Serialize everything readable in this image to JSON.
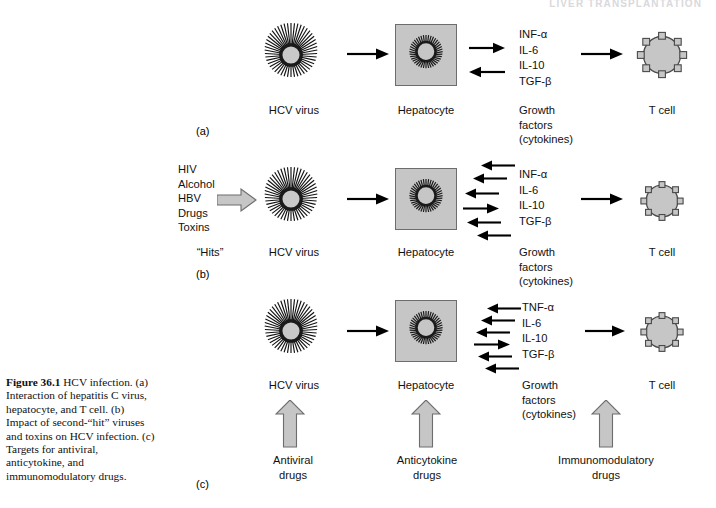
{
  "running_head": "LIVER TRANSPLANTATION",
  "caption": {
    "figure_number": "Figure 36.1",
    "text": "  HCV infection. (a) Interaction of hepatitis C virus, hepatocyte, and T cell. (b) Impact of second-“hit” viruses and toxins on HCV infection. (c) Targets for antiviral, anticytokine, and immunomodulatory drugs."
  },
  "colors": {
    "cell_fill": "#c6c6c6",
    "cell_stroke": "#6d6d6d",
    "arrow_black": "#000000",
    "block_arrow_fill": "#c6c6c6",
    "block_arrow_stroke": "#6d6d6d",
    "running_head": "#d9d9dd"
  },
  "panels": [
    {
      "id": "a",
      "letter": "(a)",
      "nodes": [
        {
          "name": "virus",
          "label": "HCV virus"
        },
        {
          "name": "hepatocyte",
          "label": "Hepatocyte"
        },
        {
          "name": "cytokines",
          "label": "Growth\nfactors\n(cytokines)"
        },
        {
          "name": "tcell",
          "label": "T cell"
        }
      ],
      "cytokines": [
        "INF-α",
        "IL-6",
        "IL-10",
        "TGF-β"
      ],
      "flow_arrows": [
        {
          "from": "virus",
          "to": "hepatocyte",
          "dir": "right"
        },
        {
          "from": "cytokines",
          "to": "tcell",
          "dir": "right"
        }
      ],
      "exchange_arrows": [
        "right",
        "left"
      ],
      "hits": null,
      "drugs": []
    },
    {
      "id": "b",
      "letter": "(b)",
      "nodes": [
        {
          "name": "hits",
          "label": "“Hits”"
        },
        {
          "name": "virus",
          "label": "HCV virus"
        },
        {
          "name": "hepatocyte",
          "label": "Hepatocyte"
        },
        {
          "name": "cytokines",
          "label": "Growth\nfactors\n(cytokines)"
        },
        {
          "name": "tcell",
          "label": "T cell"
        }
      ],
      "cytokines": [
        "INF-α",
        "IL-6",
        "IL-10",
        "TGF-β"
      ],
      "hits": [
        "HIV",
        "Alcohol",
        "HBV",
        "Drugs",
        "Toxins"
      ],
      "flow_arrows": [
        {
          "from": "virus",
          "to": "hepatocyte",
          "dir": "right"
        },
        {
          "from": "cytokines",
          "to": "tcell",
          "dir": "right"
        }
      ],
      "exchange_arrows": [
        "left",
        "left",
        "left",
        "right",
        "left",
        "left"
      ],
      "drugs": []
    },
    {
      "id": "c",
      "letter": "(c)",
      "nodes": [
        {
          "name": "virus",
          "label": "HCV virus"
        },
        {
          "name": "hepatocyte",
          "label": "Hepatocyte"
        },
        {
          "name": "cytokines",
          "label": "Growth\nfactors\n(cytokines)"
        },
        {
          "name": "tcell",
          "label": "T cell"
        }
      ],
      "cytokines": [
        "TNF-α",
        "IL-6",
        "IL-10",
        "TGF-β"
      ],
      "flow_arrows": [
        {
          "from": "virus",
          "to": "hepatocyte",
          "dir": "right"
        },
        {
          "from": "cytokines",
          "to": "tcell",
          "dir": "right"
        }
      ],
      "exchange_arrows": [
        "left",
        "left",
        "left",
        "right",
        "left",
        "left"
      ],
      "hits": null,
      "drugs": [
        {
          "target": "virus",
          "label": "Antiviral\ndrugs"
        },
        {
          "target": "hepatocyte",
          "label": "Anticytokine\ndrugs"
        },
        {
          "target": "cytokines",
          "label": "Immunomodulatory\ndrugs"
        }
      ]
    }
  ],
  "cytokine_caption_lines": [
    "Growth",
    "factors",
    "(cytokines)"
  ]
}
